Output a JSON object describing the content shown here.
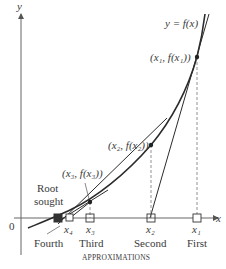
{
  "figure": {
    "y_axis_label": "y",
    "x_axis_label": "x",
    "origin_label": "0",
    "curve_label": "y = f(x)",
    "points": [
      {
        "label": "(x₁, f(x₁))",
        "x_label": "x₁",
        "approx": "First"
      },
      {
        "label": "(x₂, f(x₂))",
        "x_label": "x₂",
        "approx": "Second"
      },
      {
        "label": "(x₃, f(x₃))",
        "x_label": "x₃",
        "approx": "Third"
      },
      {
        "label": "",
        "x_label": "x₄",
        "approx": "Fourth"
      }
    ],
    "root_label_line1": "Root",
    "root_label_line2": "sought",
    "caption": "APPROXIMATIONS"
  },
  "colors": {
    "line": "#2b2b2b",
    "axis": "#555555",
    "dashed": "#666666",
    "text": "#3a3a3a",
    "root_fill": "#333333"
  }
}
